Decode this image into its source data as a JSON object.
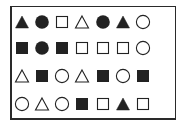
{
  "colors": {
    "ink": "#222222",
    "frame": "#2a2a2a",
    "background": "#ffffff"
  },
  "grid": {
    "rows": 4,
    "cols": 7,
    "col_x": [
      12,
      32,
      52,
      72,
      93,
      113,
      133
    ],
    "row_y": [
      16,
      42,
      70,
      98
    ],
    "cells": [
      [
        "triangle-filled",
        "circle-filled",
        "square-outline",
        "triangle-outline",
        "circle-filled",
        "triangle-filled",
        "circle-outline"
      ],
      [
        "square-filled",
        "circle-filled",
        "square-filled",
        "square-outline",
        "square-outline",
        "square-outline",
        "circle-outline"
      ],
      [
        "triangle-outline",
        "square-filled",
        "circle-outline",
        "triangle-outline",
        "square-filled",
        "circle-outline",
        "square-filled"
      ],
      [
        "circle-outline",
        "triangle-outline",
        "circle-outline",
        "square-filled",
        "square-outline",
        "triangle-filled",
        "square-outline"
      ]
    ]
  }
}
